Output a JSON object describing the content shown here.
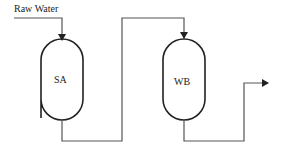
{
  "diagram": {
    "input_label": "Raw Water",
    "vessels": [
      {
        "id": "SA",
        "label": "SA"
      },
      {
        "id": "WB",
        "label": "WB"
      }
    ],
    "line_color": "#555555",
    "vessel_color": "#222222"
  }
}
